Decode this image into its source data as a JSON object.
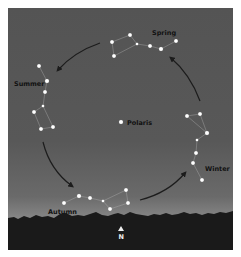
{
  "labels": {
    "spring": "Spring",
    "summer": "Summer",
    "autumn": "Autumn",
    "winter": "Winter",
    "polaris": "Polaris",
    "north": "N"
  },
  "colors": {
    "sky_top": "#545454",
    "sky_horizon": "#9a9a9a",
    "treeline": "#1a1a1a",
    "star": "#ffffff",
    "arrow": "#1c1c1c"
  },
  "constellations": [
    {
      "season": "Spring",
      "stars": [
        [
          112,
          42
        ],
        [
          130,
          35
        ],
        [
          137,
          44
        ],
        [
          150,
          46
        ],
        [
          161,
          49
        ],
        [
          176,
          41
        ],
        [
          114,
          56
        ]
      ]
    },
    {
      "season": "Summer",
      "stars": [
        [
          39,
          66
        ],
        [
          47,
          81
        ],
        [
          45,
          92
        ],
        [
          43,
          106
        ],
        [
          34,
          112
        ],
        [
          41,
          129
        ],
        [
          53,
          127
        ]
      ]
    },
    {
      "season": "Winter",
      "stars": [
        [
          187,
          116
        ],
        [
          200,
          114
        ],
        [
          207,
          133
        ],
        [
          197,
          140
        ],
        [
          196,
          153
        ],
        [
          193,
          163
        ],
        [
          202,
          180
        ]
      ]
    },
    {
      "season": "Autumn",
      "stars": [
        [
          64,
          203
        ],
        [
          79,
          196
        ],
        [
          90,
          198
        ],
        [
          103,
          201
        ],
        [
          126,
          190
        ],
        [
          128,
          203
        ],
        [
          110,
          209
        ]
      ]
    }
  ],
  "polaris": [
    121,
    122
  ]
}
